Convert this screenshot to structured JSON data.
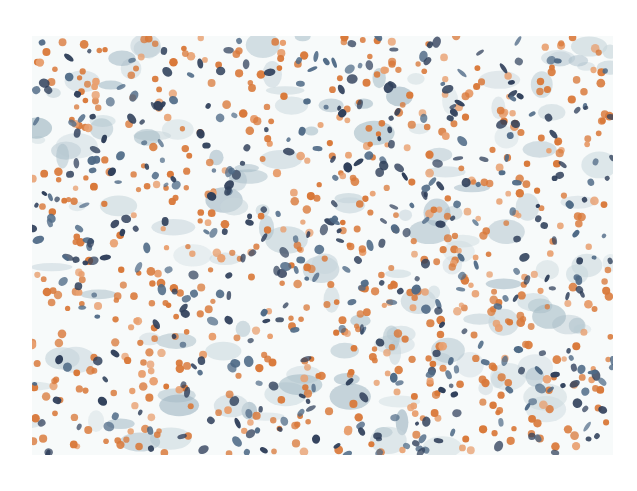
{
  "image": {
    "subject": "cytology smear micrograph",
    "stain_colors": {
      "background": "#f7fafa",
      "red_cells": "#d9793a",
      "red_cells_light": "#e8a070",
      "nuclei_dark": "#2f3f5a",
      "nuclei_mid": "#4f6a86",
      "cytoplasm": "#9fb6c2",
      "cytoplasm_light": "#c8d6dc"
    },
    "frame": {
      "x": 32,
      "y": 36,
      "width": 581,
      "height": 419
    }
  }
}
